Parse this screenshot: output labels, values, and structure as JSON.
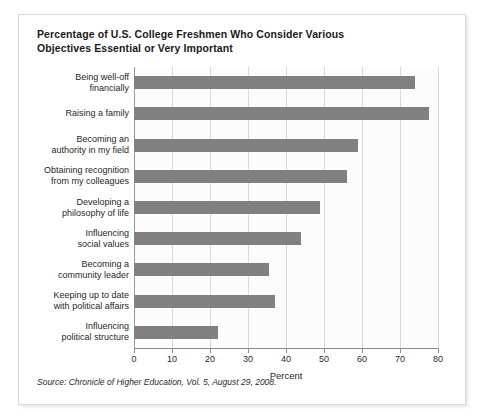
{
  "chart_data": {
    "type": "bar",
    "orientation": "horizontal",
    "title": "Percentage of U.S. College Freshmen Who Consider Various Objectives Essential or Very Important",
    "title_lines": [
      "Percentage of U.S. College Freshmen Who Consider Various",
      "Objectives Essential or Very Important"
    ],
    "categories": [
      "Being well-off financially",
      "Raising a family",
      "Becoming an authority in my field",
      "Obtaining recognition from my colleagues",
      "Developing a philosophy of life",
      "Influencing social values",
      "Becoming a community leader",
      "Keeping up to date with political affairs",
      "Influencing political structure"
    ],
    "category_lines": [
      [
        "Being well-off",
        "financially"
      ],
      [
        "Raising a family"
      ],
      [
        "Becoming an",
        "authority in my field"
      ],
      [
        "Obtaining recognition",
        "from my colleagues"
      ],
      [
        "Developing a",
        "philosophy of life"
      ],
      [
        "Influencing",
        "social values"
      ],
      [
        "Becoming a",
        "community leader"
      ],
      [
        "Keeping up to date",
        "with political affairs"
      ],
      [
        "Influencing",
        "political structure"
      ]
    ],
    "values": [
      74,
      77.5,
      59,
      56,
      49,
      44,
      35.5,
      37,
      22
    ],
    "xlabel": "Percent",
    "ylabel": "",
    "xlim": [
      0,
      80
    ],
    "xticks": [
      0,
      10,
      20,
      30,
      40,
      50,
      60,
      70,
      80
    ],
    "xtick_labels": [
      "0",
      "10",
      "20",
      "30",
      "40",
      "50",
      "60",
      "70",
      "80"
    ],
    "grid": true,
    "grid_axis": "x",
    "legend": false,
    "bar_color": "#808080",
    "gridline_color": "#d9d9d9",
    "axis_color": "#8c8c8c",
    "plot_background": "#fcfcfc"
  },
  "source": {
    "prefix": "Source:",
    "publication": "Chronicle of Higher Education",
    "details": ", Vol. 5, August 29, 2008.",
    "full_text": "Source: Chronicle of Higher Education, Vol. 5, August 29, 2008."
  }
}
